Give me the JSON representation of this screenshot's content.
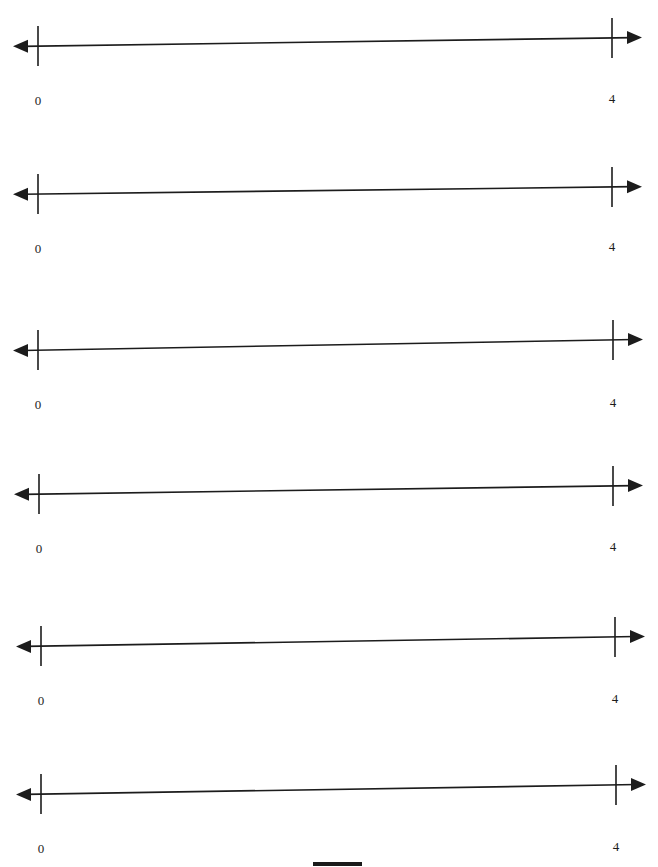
{
  "document": {
    "title": "Number Lines Worksheet",
    "background_color": "#ffffff",
    "width": 658,
    "height": 867,
    "ink_color": "#1c1c1c"
  },
  "number_lines": [
    {
      "index": 1,
      "left_tick_label": "0",
      "right_tick_label": "4",
      "left_arrow": "arrow-left",
      "right_arrow": "arrow-right",
      "axis_top": 18,
      "left_x": 38,
      "right_x": 612,
      "left_y": 28,
      "right_y": 20,
      "label_y": 76
    },
    {
      "index": 2,
      "left_tick_label": "0",
      "right_tick_label": "4",
      "left_arrow": "arrow-left",
      "right_arrow": "arrow-right",
      "axis_top": 166,
      "left_x": 38,
      "right_x": 612,
      "left_y": 28,
      "right_y": 21,
      "label_y": 76
    },
    {
      "index": 3,
      "left_tick_label": "0",
      "right_tick_label": "4",
      "left_arrow": "arrow-left",
      "right_arrow": "arrow-right",
      "axis_top": 320,
      "left_x": 38,
      "right_x": 613,
      "left_y": 30,
      "right_y": 20,
      "label_y": 78
    },
    {
      "index": 4,
      "left_tick_label": "0",
      "right_tick_label": "4",
      "left_arrow": "arrow-left",
      "right_arrow": "arrow-right",
      "axis_top": 465,
      "left_x": 39,
      "right_x": 613,
      "left_y": 29,
      "right_y": 21,
      "label_y": 77
    },
    {
      "index": 5,
      "left_tick_label": "0",
      "right_tick_label": "4",
      "left_arrow": "arrow-left",
      "right_arrow": "arrow-right",
      "axis_top": 616,
      "left_x": 41,
      "right_x": 615,
      "left_y": 30,
      "right_y": 21,
      "label_y": 78
    },
    {
      "index": 6,
      "left_tick_label": "0",
      "right_tick_label": "4",
      "left_arrow": "arrow-left",
      "right_arrow": "arrow-right",
      "axis_top": 764,
      "left_x": 41,
      "right_x": 616,
      "left_y": 30,
      "right_y": 21,
      "label_y": 78
    }
  ],
  "bottom_mark": {
    "name": "page-edge-mark",
    "left": 313,
    "top": 862,
    "width": 49,
    "height": 4,
    "color": "#1a1a1a"
  }
}
